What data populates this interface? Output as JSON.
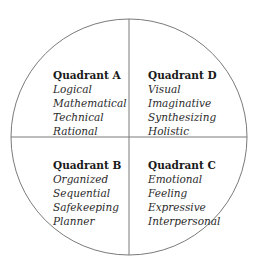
{
  "diagram": {
    "shape": "circle-divided-into-four-quadrants",
    "line_color": "#7a7a7a",
    "background": "#ffffff"
  },
  "quadrants": {
    "a": {
      "title": "Quadrant A",
      "traits": [
        "Logical",
        "Mathematical",
        "Technical",
        "Rational"
      ]
    },
    "d": {
      "title": "Quadrant D",
      "traits": [
        "Visual",
        "Imaginative",
        "Synthesizing",
        "Holistic"
      ]
    },
    "b": {
      "title": "Quadrant B",
      "traits": [
        "Organized",
        "Sequential",
        "Safekeeping",
        "Planner"
      ]
    },
    "c": {
      "title": "Quadrant C",
      "traits": [
        "Emotional",
        "Feeling",
        "Expressive",
        "Interpersonal"
      ]
    }
  }
}
